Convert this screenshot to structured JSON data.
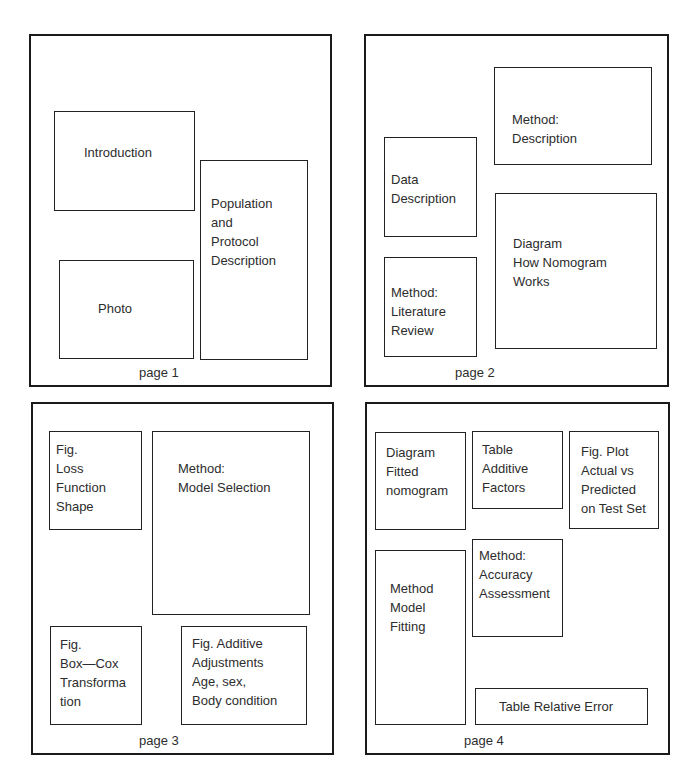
{
  "figure": {
    "pages": [
      {
        "label": "page 1",
        "sections": [
          {
            "id": "introduction",
            "text": "Introduction"
          },
          {
            "id": "population-protocol",
            "text": "Population\nand\nProtocol\nDescription"
          },
          {
            "id": "photo",
            "text": "Photo"
          }
        ]
      },
      {
        "label": "page 2",
        "sections": [
          {
            "id": "method-description",
            "text": "Method:\nDescription"
          },
          {
            "id": "data-description",
            "text": "Data\nDescription"
          },
          {
            "id": "method-literature-review",
            "text": "Method:\nLiterature\nReview"
          },
          {
            "id": "diagram-how-nomogram-works",
            "text": "Diagram\nHow Nomogram\nWorks"
          }
        ]
      },
      {
        "label": "page 3",
        "sections": [
          {
            "id": "fig-loss-function-shape",
            "text": "Fig.\nLoss\nFunction\nShape"
          },
          {
            "id": "method-model-selection",
            "text": "Method:\nModel Selection"
          },
          {
            "id": "fig-box-cox",
            "text": "Fig.\nBox—Cox\nTransforma\ntion"
          },
          {
            "id": "fig-additive-adjustments",
            "text": "Fig.  Additive\nAdjustments\nAge, sex,\nBody condition"
          }
        ]
      },
      {
        "label": "page 4",
        "sections": [
          {
            "id": "diagram-fitted-nomogram",
            "text": "Diagram\nFitted\nnomogram"
          },
          {
            "id": "table-additive-factors",
            "text": "Table\nAdditive\nFactors"
          },
          {
            "id": "fig-plot-actual-vs-predicted",
            "text": "Fig.  Plot\nActual vs\nPredicted\non Test Set"
          },
          {
            "id": "method-model-fitting",
            "text": "Method\nModel\nFitting"
          },
          {
            "id": "method-accuracy-assessment",
            "text": "Method:\nAccuracy\nAssessment"
          },
          {
            "id": "table-relative-error",
            "text": "Table Relative Error"
          }
        ]
      }
    ]
  }
}
